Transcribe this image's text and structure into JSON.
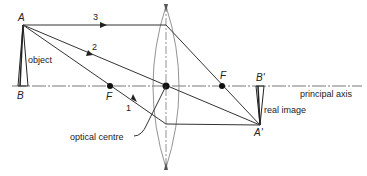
{
  "diagram": {
    "labels": {
      "object_top": "A",
      "object_base": "B",
      "object": "object",
      "focal_left": "F",
      "focal_right": "F",
      "image_top": "A'",
      "image_base": "B'",
      "image": "real image",
      "principal_axis": "principal axis",
      "optical_centre": "optical centre",
      "ray1": "1",
      "ray2": "2",
      "ray3": "3"
    },
    "colors": {
      "line": "#333333",
      "text": "#222222",
      "background": "#ffffff"
    }
  }
}
